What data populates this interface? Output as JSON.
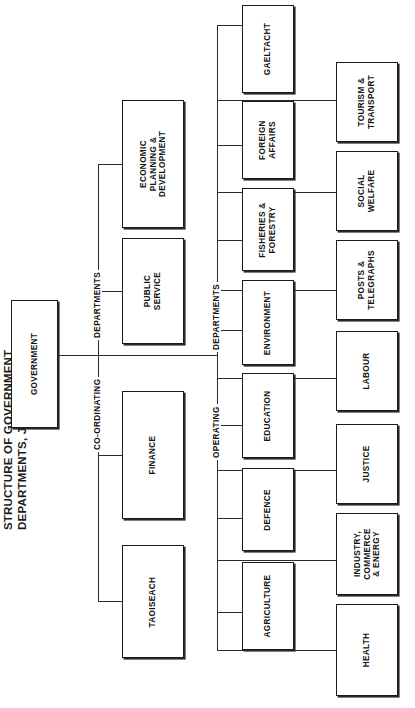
{
  "title": {
    "line1": "STRUCTURE OF GOVERNMENT",
    "line2": "DEPARTMENTS, JUNE, 1979."
  },
  "colors": {
    "box_border": "#1a1a1a",
    "connector": "#2b2b2b",
    "background": "#ffffff",
    "text": "#141414"
  },
  "root": {
    "label": "GOVERNMENT"
  },
  "group_labels": {
    "coordinating": "CO-ORDINATING",
    "coordinating_departments": "DEPARTMENTS",
    "operating": "OPERATING",
    "operating_departments": "DEPARTMENTS"
  },
  "coordinating_departments": [
    {
      "line1": "ECONOMIC",
      "line2": "PLANNING &",
      "line3": "DEVELOPMENT"
    },
    {
      "line1": "PUBLIC",
      "line2": "SERVICE"
    },
    {
      "line1": "FINANCE"
    },
    {
      "line1": "TAOISEACH"
    }
  ],
  "operating_departments_column_a": [
    {
      "line1": "GAELTACHT"
    },
    {
      "line1": "FOREIGN",
      "line2": "AFFAIRS"
    },
    {
      "line1": "FISHERIES &",
      "line2": "FORESTRY"
    },
    {
      "line1": "ENVIRONMENT"
    },
    {
      "line1": "EDUCATION"
    },
    {
      "line1": "DEFENCE"
    },
    {
      "line1": "AGRICULTURE"
    }
  ],
  "operating_departments_column_b": [
    {
      "line1": "TOURISM &",
      "line2": "TRANSPORT"
    },
    {
      "line1": "SOCIAL",
      "line2": "WELFARE"
    },
    {
      "line1": "POSTS &",
      "line2": "TELEGRAPHS"
    },
    {
      "line1": "LABOUR"
    },
    {
      "line1": "JUSTICE"
    },
    {
      "line1": "INDUSTRY,",
      "line2": "COMMERCE",
      "line3": "& ENERGY"
    },
    {
      "line1": "HEALTH"
    }
  ]
}
